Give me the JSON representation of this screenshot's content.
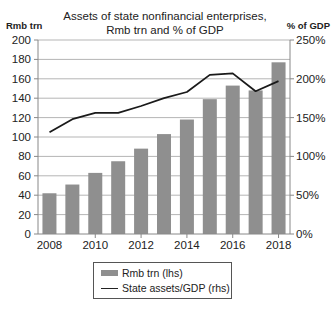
{
  "chart": {
    "title_line1": "Assets of state nonfinancial enterprises,",
    "title_line2": "Rmb trn and % of GDP",
    "left_unit": "Rmb trn",
    "right_unit": "% of GDP",
    "legend": {
      "bar_label": "Rmb trn (lhs)",
      "line_label": "State assets/GDP (rhs)"
    },
    "colors": {
      "bar": "#8f8f8f",
      "line": "#1a1a1a",
      "grid": "#b5b5b5",
      "axis": "#888888"
    }
  },
  "chart_data": {
    "type": "bar",
    "title": "Assets of state nonfinancial enterprises, Rmb trn and % of GDP",
    "categories": [
      "2008",
      "2009",
      "2010",
      "2011",
      "2012",
      "2013",
      "2014",
      "2015",
      "2016",
      "2017",
      "2018"
    ],
    "x_tick_labels": [
      "2008",
      "2010",
      "2012",
      "2014",
      "2016",
      "2018"
    ],
    "series": [
      {
        "name": "Rmb trn (lhs)",
        "type": "bar",
        "axis": "left",
        "values": [
          42,
          51,
          63,
          75,
          88,
          103,
          118,
          139,
          153,
          148,
          177
        ]
      },
      {
        "name": "State assets/GDP (rhs)",
        "type": "line",
        "axis": "right",
        "values": [
          131,
          148,
          156,
          156,
          165,
          175,
          183,
          205,
          207,
          184,
          197
        ]
      }
    ],
    "ylabel": "Rmb trn",
    "ylabel_right": "% of GDP",
    "ylim": [
      0,
      200
    ],
    "ylim_right": [
      0,
      250
    ],
    "y_ticks": [
      "0",
      "20",
      "40",
      "60",
      "80",
      "100",
      "120",
      "140",
      "160",
      "180",
      "200"
    ],
    "y_ticks_right": [
      "0%",
      "50%",
      "100%",
      "150%",
      "200%",
      "250%"
    ],
    "grid": true,
    "legend_position": "bottom-center"
  }
}
